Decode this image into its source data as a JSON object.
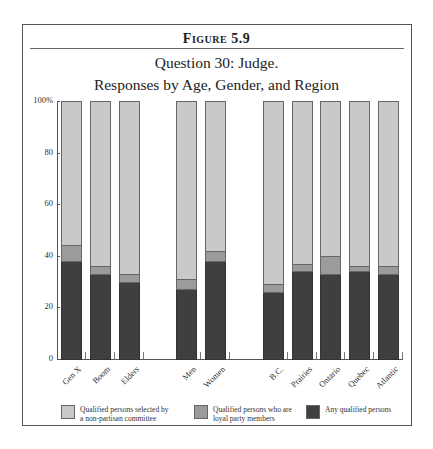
{
  "figure": {
    "label": "Figure 5.9",
    "title_line1": "Question 30: Judge.",
    "title_line2": "Responses by Age, Gender, and Region"
  },
  "colors": {
    "light": "#c9c9c9",
    "mid": "#9b9b9b",
    "dark": "#3f3f3f",
    "border": "#666666"
  },
  "axis": {
    "y_ticks": [
      "0",
      "20",
      "40",
      "60",
      "80",
      "100%"
    ]
  },
  "legend": [
    {
      "label": "Qualified persons selected by a non-partisan committee",
      "line1": "Qualified persons selected by",
      "line2": "a non-partisan committee",
      "color": "#c9c9c9"
    },
    {
      "label": "Qualified persons who are loyal party members",
      "line1": "Qualified persons who are",
      "line2": "loyal party members",
      "color": "#9b9b9b"
    },
    {
      "label": "Any qualified persons",
      "line1": "Any qualified persons",
      "line2": "",
      "color": "#3f3f3f"
    }
  ],
  "chart_data": {
    "type": "bar",
    "stacked": true,
    "xlabel": "",
    "ylabel": "",
    "ylim": [
      0,
      100
    ],
    "yticks": [
      0,
      20,
      40,
      60,
      80,
      100
    ],
    "ytick_labels": [
      "0",
      "20",
      "40",
      "60",
      "80",
      "100%"
    ],
    "grid": false,
    "legend_position": "bottom",
    "groups": [
      {
        "name": "Age",
        "categories": [
          "Gen X",
          "Boom",
          "Elders"
        ]
      },
      {
        "name": "Gender",
        "categories": [
          "Men",
          "Women"
        ]
      },
      {
        "name": "Region",
        "categories": [
          "B.C.",
          "Prairies",
          "Ontario",
          "Quebec",
          "Atlantic"
        ]
      }
    ],
    "categories": [
      "Gen X",
      "Boom",
      "Elders",
      "Men",
      "Women",
      "B.C.",
      "Prairies",
      "Ontario",
      "Quebec",
      "Atlantic"
    ],
    "series": [
      {
        "name": "Any qualified persons",
        "values": [
          38,
          33,
          30,
          27,
          38,
          26,
          34,
          33,
          34,
          33
        ]
      },
      {
        "name": "Qualified persons who are loyal party members",
        "values": [
          6,
          3,
          3,
          4,
          4,
          3,
          3,
          7,
          2,
          3
        ]
      },
      {
        "name": "Qualified persons selected by a non-partisan committee",
        "values": [
          56,
          64,
          67,
          69,
          58,
          71,
          63,
          60,
          64,
          64
        ]
      }
    ]
  }
}
